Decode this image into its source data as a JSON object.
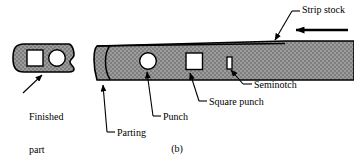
{
  "figure": {
    "caption": "(b)",
    "colors": {
      "outline": "#000000",
      "metal_fill": "#9a9a9a",
      "hatch_dot": "#5a5a5a",
      "hole_fill": "#ffffff",
      "background": "#ffffff",
      "leader_line": "#000000"
    }
  },
  "labels": {
    "strip_stock": "Strip stock",
    "seminotch": "Seminotch",
    "square_punch": "Square punch",
    "punch": "Punch",
    "parting": "Parting",
    "finished_part_line1": "Finished",
    "finished_part_line2": "part"
  },
  "parts": {
    "finished_part": {
      "name": "finished-part",
      "features": [
        "square-hole",
        "round-hole",
        "seminotch-edge-profile"
      ]
    },
    "strip_stock": {
      "name": "strip-stock",
      "feed_direction": "right-to-left",
      "features": [
        "parting-line",
        "round-punch-hole",
        "square-punch-hole",
        "seminotch-slot"
      ]
    }
  },
  "icons": {
    "feed_arrow": "arrow-left-icon"
  }
}
